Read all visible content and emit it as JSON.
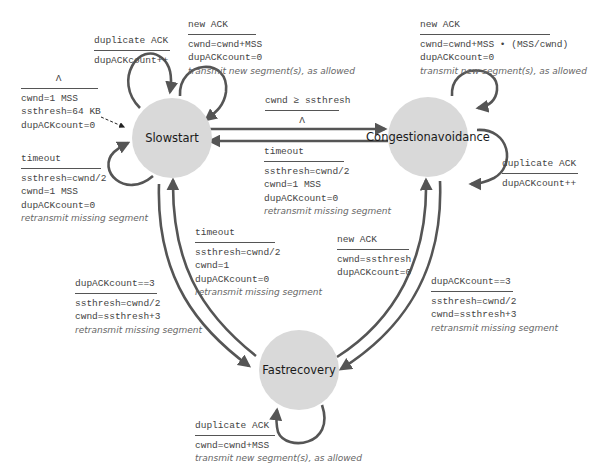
{
  "states": {
    "slow_start": {
      "line1": "Slow",
      "line2": "start"
    },
    "congestion_avoidance": {
      "line1": "Congestion",
      "line2": "avoidance"
    },
    "fast_recovery": {
      "line1": "Fast",
      "line2": "recovery"
    }
  },
  "transitions": {
    "init": {
      "event": "Λ",
      "actions": [
        "cwnd=1 MSS",
        "ssthresh=64 KB",
        "dupACKcount=0"
      ]
    },
    "ss_dup_ack": {
      "event": "duplicate ACK",
      "actions": [
        "dupACKcount++"
      ]
    },
    "ss_new_ack": {
      "event": "new ACK",
      "actions": [
        "cwnd=cwnd+MSS",
        "dupACKcount=0"
      ],
      "note": "transmit new segment(s), as allowed"
    },
    "ss_timeout": {
      "event": "timeout",
      "actions": [
        "ssthresh=cwnd/2",
        "cwnd=1 MSS",
        "dupACKcount=0"
      ],
      "note": "retransmit missing segment"
    },
    "ss_to_ca": {
      "event": "cwnd ≥ ssthresh",
      "actions": [
        "Λ"
      ]
    },
    "ca_new_ack": {
      "event": "new ACK",
      "actions": [
        "cwnd=cwnd+MSS • (MSS/cwnd)",
        "dupACKcount=0"
      ],
      "note": "transmit new segment(s), as allowed"
    },
    "ca_dup_ack": {
      "event": "duplicate ACK",
      "actions": [
        "dupACKcount++"
      ]
    },
    "ca_timeout": {
      "event": "timeout",
      "actions": [
        "ssthresh=cwnd/2",
        "cwnd=1 MSS",
        "dupACKcount=0"
      ],
      "note": "retransmit missing segment"
    },
    "fr_timeout": {
      "event": "timeout",
      "actions": [
        "ssthresh=cwnd/2",
        "cwnd=1",
        "dupACKcount=0"
      ],
      "note": "retransmit missing segment"
    },
    "ss_to_fr": {
      "event": "dupACKcount==3",
      "actions": [
        "ssthresh=cwnd/2",
        "cwnd=ssthresh+3"
      ],
      "note": "retransmit missing segment"
    },
    "fr_new_ack": {
      "event": "new ACK",
      "actions": [
        "cwnd=ssthresh",
        "dupACKcount=0"
      ]
    },
    "ca_to_fr": {
      "event": "dupACKcount==3",
      "actions": [
        "ssthresh=cwnd/2",
        "cwnd=ssthresh+3"
      ],
      "note": "retransmit missing segment"
    },
    "fr_dup_ack": {
      "event": "duplicate ACK",
      "actions": [
        "cwnd=cwnd+MSS"
      ],
      "note": "transmit new segment(s), as allowed"
    }
  },
  "colors": {
    "state_fill": "#d9d9d9",
    "arrow": "#555555",
    "text": "#444444"
  }
}
